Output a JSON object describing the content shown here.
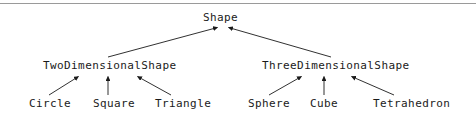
{
  "diagram": {
    "background_color": "#ffffff",
    "text_color": "#1a1a1a",
    "line_color": "#1a1a1a",
    "rule_color": "#9a9a9a"
  },
  "nodes": {
    "root": {
      "label": "Shape"
    },
    "two_dimensional": {
      "label": "TwoDimensionalShape"
    },
    "three_dimensional": {
      "label": "ThreeDimensionalShape"
    },
    "circle": {
      "label": "Circle"
    },
    "square": {
      "label": "Square"
    },
    "triangle": {
      "label": "Triangle"
    },
    "sphere": {
      "label": "Sphere"
    },
    "cube": {
      "label": "Cube"
    },
    "tetrahedron": {
      "label": "Tetrahedron"
    }
  },
  "edges": [
    {
      "from": "TwoDimensionalShape",
      "to": "Shape"
    },
    {
      "from": "ThreeDimensionalShape",
      "to": "Shape"
    },
    {
      "from": "Circle",
      "to": "TwoDimensionalShape"
    },
    {
      "from": "Square",
      "to": "TwoDimensionalShape"
    },
    {
      "from": "Triangle",
      "to": "TwoDimensionalShape"
    },
    {
      "from": "Sphere",
      "to": "ThreeDimensionalShape"
    },
    {
      "from": "Cube",
      "to": "ThreeDimensionalShape"
    },
    {
      "from": "Tetrahedron",
      "to": "ThreeDimensionalShape"
    }
  ]
}
